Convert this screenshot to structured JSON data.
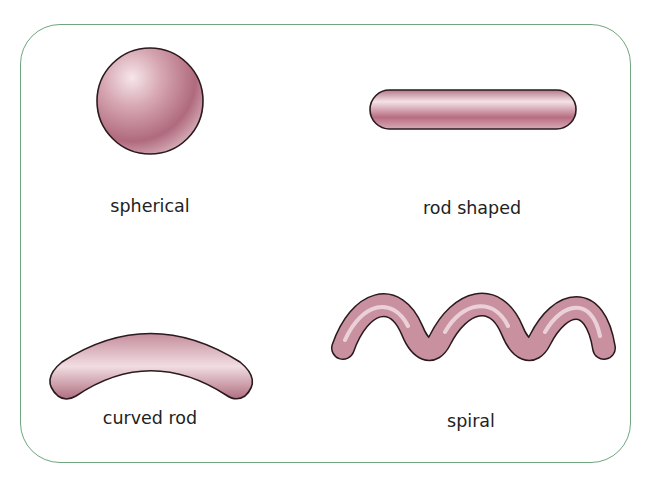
{
  "diagram": {
    "title": "",
    "frame_color": "#6fa57f",
    "fill_color": "#c9909f",
    "outline_color": "#2a1a1e",
    "shapes": [
      {
        "id": "spherical",
        "label": "spherical"
      },
      {
        "id": "rod",
        "label": "rod shaped"
      },
      {
        "id": "curved-rod",
        "label": "curved rod"
      },
      {
        "id": "spiral",
        "label": "spiral"
      }
    ]
  }
}
